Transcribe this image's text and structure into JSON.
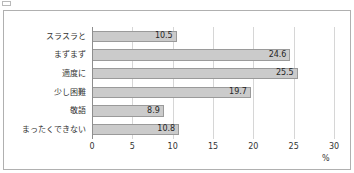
{
  "caption": {
    "marker_icon": "square-bullet-icon",
    "text": ""
  },
  "chart_data": {
    "type": "bar",
    "orientation": "horizontal",
    "title": "",
    "xlabel": "%",
    "ylabel": "",
    "categories": [
      "スラスラと",
      "まずまず",
      "適度に",
      "少し困難",
      "敬語",
      "まったくできない"
    ],
    "values": [
      10.5,
      24.6,
      25.5,
      19.7,
      8.9,
      10.8
    ],
    "value_labels": [
      "10.5",
      "24.6",
      "25.5",
      "19.7",
      "8.9",
      "10.8"
    ],
    "xlim": [
      0,
      30
    ],
    "xticks": [
      0,
      5,
      10,
      15,
      20,
      25,
      30
    ],
    "xtick_labels": [
      "0",
      "5",
      "10",
      "15",
      "20",
      "25",
      "30"
    ],
    "unit": "%",
    "grid": true,
    "legend": false,
    "bar_color": "#cbcbcb",
    "bar_border_color": "#9a9a9a",
    "gridline_color": "#d6d6d6",
    "axis_color": "#8e8e8e",
    "frame_color": "#b0b0b0",
    "text_color": "#333333"
  }
}
